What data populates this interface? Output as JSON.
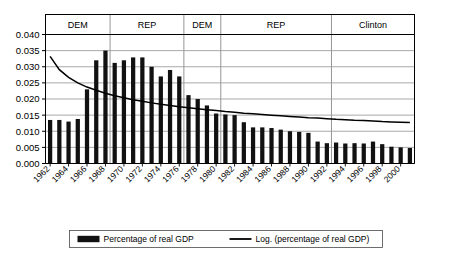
{
  "chart_data": {
    "type": "bar",
    "title": "",
    "subtitle": "",
    "xlabel": "",
    "ylabel": "",
    "ylim": [
      0.0,
      0.04
    ],
    "yticks": [
      "0.000",
      "0.005",
      "0.010",
      "0.015",
      "0.020",
      "0.025",
      "0.030",
      "0.035",
      "0.040"
    ],
    "ytick_values": [
      0.0,
      0.005,
      0.01,
      0.015,
      0.02,
      0.025,
      0.03,
      0.035,
      0.04
    ],
    "grid": true,
    "legend_position": "bottom",
    "x": [
      1962,
      1963,
      1964,
      1965,
      1966,
      1967,
      1968,
      1969,
      1970,
      1971,
      1972,
      1973,
      1974,
      1975,
      1976,
      1977,
      1978,
      1979,
      1980,
      1981,
      1982,
      1983,
      1984,
      1985,
      1986,
      1987,
      1988,
      1989,
      1990,
      1991,
      1992,
      1993,
      1994,
      1995,
      1996,
      1997,
      1998,
      1999,
      2000,
      2001
    ],
    "xtick_labels": [
      "1962",
      "1964",
      "1966",
      "1968",
      "1970",
      "1972",
      "1974",
      "1976",
      "1978",
      "1980",
      "1982",
      "1984",
      "1986",
      "1988",
      "1990",
      "1992",
      "1994",
      "1996",
      "1998",
      "2000"
    ],
    "xtick_values": [
      1962,
      1964,
      1966,
      1968,
      1970,
      1972,
      1974,
      1976,
      1978,
      1980,
      1982,
      1984,
      1986,
      1988,
      1990,
      1992,
      1994,
      1996,
      1998,
      2000
    ],
    "categories": [
      "1962",
      "1963",
      "1964",
      "1965",
      "1966",
      "1967",
      "1968",
      "1969",
      "1970",
      "1971",
      "1972",
      "1973",
      "1974",
      "1975",
      "1976",
      "1977",
      "1978",
      "1979",
      "1980",
      "1981",
      "1982",
      "1983",
      "1984",
      "1985",
      "1986",
      "1987",
      "1988",
      "1989",
      "1990",
      "1991",
      "1992",
      "1993",
      "1994",
      "1995",
      "1996",
      "1997",
      "1998",
      "1999",
      "2000",
      "2001"
    ],
    "series": [
      {
        "name": "Percentage of real GDP",
        "type": "bar",
        "color": "#111111",
        "values": [
          0.0135,
          0.0135,
          0.013,
          0.0138,
          0.023,
          0.032,
          0.035,
          0.0312,
          0.032,
          0.0329,
          0.0329,
          0.03,
          0.027,
          0.029,
          0.027,
          0.0212,
          0.02,
          0.018,
          0.0155,
          0.0152,
          0.015,
          0.0128,
          0.0112,
          0.0112,
          0.011,
          0.0105,
          0.01,
          0.0098,
          0.0095,
          0.0068,
          0.0063,
          0.0065,
          0.0062,
          0.0063,
          0.0062,
          0.0068,
          0.006,
          0.0052,
          0.005,
          0.0048
        ]
      },
      {
        "name": "Log. (percentage of real GDP)",
        "type": "line",
        "color": "#000000",
        "values": [
          0.0332,
          0.0291,
          0.0267,
          0.025,
          0.0237,
          0.0227,
          0.0218,
          0.021,
          0.0204,
          0.0198,
          0.0193,
          0.0188,
          0.0184,
          0.018,
          0.0176,
          0.0173,
          0.017,
          0.0167,
          0.0164,
          0.0161,
          0.0159,
          0.0156,
          0.0154,
          0.0152,
          0.015,
          0.0148,
          0.0146,
          0.0144,
          0.0142,
          0.0141,
          0.0139,
          0.0137,
          0.0136,
          0.0134,
          0.0133,
          0.0132,
          0.013,
          0.0129,
          0.0128,
          0.0127
        ]
      }
    ],
    "eras": [
      {
        "label": "DEM",
        "start": 1962,
        "end": 1968
      },
      {
        "label": "REP",
        "start": 1969,
        "end": 1976
      },
      {
        "label": "DEM",
        "start": 1977,
        "end": 1980
      },
      {
        "label": "REP",
        "start": 1981,
        "end": 1992
      },
      {
        "label": "Clinton",
        "start": 1993,
        "end": 2001
      }
    ],
    "legend": [
      {
        "label": "Percentage of real GDP",
        "marker": "bar-swatch"
      },
      {
        "label": "Log. (percentage of real GDP)",
        "marker": "line-swatch"
      }
    ]
  },
  "colors": {
    "bar": "#111111",
    "trend": "#000000",
    "grid": "#9a9a9a",
    "axis": "#000000",
    "background": "#ffffff"
  }
}
